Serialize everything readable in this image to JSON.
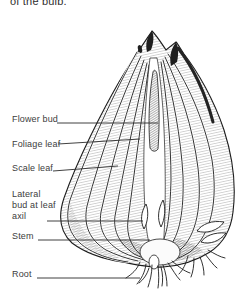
{
  "caption_top": "of the bulb.",
  "figure": {
    "ink_color": "#1c1c1c",
    "label_color": "#3d3d3d",
    "labels": [
      {
        "id": "flower-bud",
        "text": "Flower bud"
      },
      {
        "id": "foliage-leaf",
        "text": "Foliage leaf"
      },
      {
        "id": "scale-leaf",
        "text": "Scale leaf"
      },
      {
        "id": "lateral-bud",
        "text": "Lateral bud at leaf axil"
      },
      {
        "id": "stem",
        "text": "Stem"
      },
      {
        "id": "root",
        "text": "Root"
      }
    ]
  }
}
